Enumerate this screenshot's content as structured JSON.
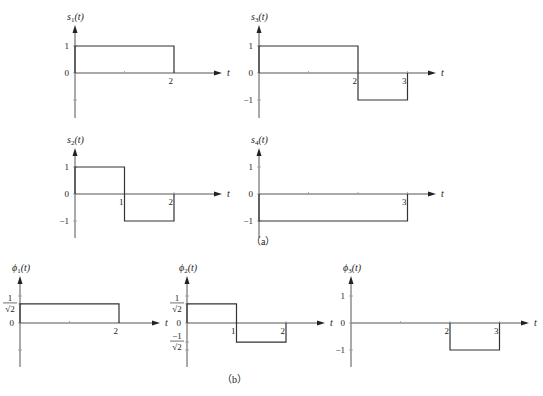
{
  "figure": {
    "part_a_caption": "（a）",
    "part_b_caption": "（b）",
    "time_axis_label": "t"
  },
  "plots": [
    {
      "id": "s1",
      "ylabel_base": "s",
      "ylabel_sub": "1",
      "ylabel_suffix": "(t)",
      "origin": [
        75,
        73
      ],
      "xunit": 49.5,
      "yunit": 27,
      "axis_top": 25,
      "axis_bottom": 118,
      "axis_right": 222,
      "yticks": [
        {
          "v": 1,
          "label": "1"
        },
        {
          "v": 0,
          "label": "0"
        },
        {
          "v": -1,
          "label": ""
        }
      ],
      "xticks": [
        {
          "v": 1,
          "label": ""
        },
        {
          "v": 2,
          "label": "2"
        }
      ],
      "segments": [
        {
          "t0": 0,
          "t1": 2,
          "v": 1
        }
      ]
    },
    {
      "id": "s3",
      "ylabel_base": "s",
      "ylabel_sub": "3",
      "ylabel_suffix": "(t)",
      "origin": [
        259,
        73
      ],
      "xunit": 49.5,
      "yunit": 27,
      "axis_top": 25,
      "axis_bottom": 118,
      "axis_right": 436,
      "yticks": [
        {
          "v": 1,
          "label": "1"
        },
        {
          "v": 0,
          "label": "0"
        },
        {
          "v": -1,
          "label": "−1"
        }
      ],
      "xticks": [
        {
          "v": 1,
          "label": ""
        },
        {
          "v": 2,
          "label": "2"
        },
        {
          "v": 3,
          "label": "3"
        }
      ],
      "segments": [
        {
          "t0": 0,
          "t1": 2,
          "v": 1
        },
        {
          "t0": 2,
          "t1": 3,
          "v": -1
        }
      ]
    },
    {
      "id": "s2",
      "ylabel_base": "s",
      "ylabel_sub": "2",
      "ylabel_suffix": "(t)",
      "origin": [
        75,
        194
      ],
      "xunit": 49.5,
      "yunit": 27,
      "axis_top": 148,
      "axis_bottom": 238,
      "axis_right": 222,
      "yticks": [
        {
          "v": 1,
          "label": "1"
        },
        {
          "v": 0,
          "label": "0"
        },
        {
          "v": -1,
          "label": "−1"
        }
      ],
      "xticks": [
        {
          "v": 1,
          "label": "1"
        },
        {
          "v": 2,
          "label": "2"
        }
      ],
      "segments": [
        {
          "t0": 0,
          "t1": 1,
          "v": 1
        },
        {
          "t0": 1,
          "t1": 2,
          "v": -1
        }
      ]
    },
    {
      "id": "s4",
      "ylabel_base": "s",
      "ylabel_sub": "4",
      "ylabel_suffix": "(t)",
      "origin": [
        259,
        194
      ],
      "xunit": 49.5,
      "yunit": 27,
      "axis_top": 148,
      "axis_bottom": 238,
      "axis_right": 436,
      "yticks": [
        {
          "v": 1,
          "label": "1"
        },
        {
          "v": 0,
          "label": "0"
        },
        {
          "v": -1,
          "label": "−1"
        }
      ],
      "xticks": [
        {
          "v": 1,
          "label": ""
        },
        {
          "v": 2,
          "label": ""
        },
        {
          "v": 3,
          "label": "3"
        }
      ],
      "segments": [
        {
          "t0": 0,
          "t1": 3,
          "v": -1
        }
      ]
    },
    {
      "id": "phi1",
      "ylabel_base": "ϕ",
      "ylabel_sub": "1",
      "ylabel_suffix": "(t)",
      "origin": [
        20,
        323
      ],
      "xunit": 49.5,
      "yunit": 27,
      "axis_top": 276,
      "axis_bottom": 367,
      "axis_right": 160,
      "yticks": [
        {
          "v": 0.7071,
          "label": "frac",
          "frac_num": "1",
          "frac_den": "√2"
        },
        {
          "v": 0,
          "label": "0"
        },
        {
          "v": 1,
          "label": ""
        },
        {
          "v": -1,
          "label": ""
        }
      ],
      "xticks": [
        {
          "v": 1,
          "label": ""
        },
        {
          "v": 2,
          "label": "2"
        }
      ],
      "segments": [
        {
          "t0": 0,
          "t1": 2,
          "v": 0.7071
        }
      ]
    },
    {
      "id": "phi2",
      "ylabel_base": "ϕ",
      "ylabel_sub": "2",
      "ylabel_suffix": "(t)",
      "origin": [
        187,
        323
      ],
      "xunit": 49.5,
      "yunit": 27,
      "axis_top": 276,
      "axis_bottom": 367,
      "axis_right": 325,
      "yticks": [
        {
          "v": 0.7071,
          "label": "frac",
          "frac_num": "1",
          "frac_den": "√2"
        },
        {
          "v": 0,
          "label": "0"
        },
        {
          "v": -0.7071,
          "label": "frac",
          "frac_num": "−1",
          "frac_den": "√2"
        },
        {
          "v": 1,
          "label": ""
        },
        {
          "v": -1,
          "label": ""
        }
      ],
      "xticks": [
        {
          "v": 1,
          "label": "1"
        },
        {
          "v": 2,
          "label": "2"
        }
      ],
      "segments": [
        {
          "t0": 0,
          "t1": 1,
          "v": 0.7071
        },
        {
          "t0": 1,
          "t1": 2,
          "v": -0.7071
        }
      ]
    },
    {
      "id": "phi3",
      "ylabel_base": "ϕ",
      "ylabel_sub": "3",
      "ylabel_suffix": "(t)",
      "origin": [
        351,
        323
      ],
      "xunit": 49.5,
      "yunit": 27,
      "axis_top": 276,
      "axis_bottom": 367,
      "axis_right": 529,
      "yticks": [
        {
          "v": 1,
          "label": "1"
        },
        {
          "v": 0,
          "label": "0"
        },
        {
          "v": -1,
          "label": "−1"
        }
      ],
      "xticks": [
        {
          "v": 1,
          "label": ""
        },
        {
          "v": 2,
          "label": "2"
        },
        {
          "v": 3,
          "label": "3"
        }
      ],
      "segments": [
        {
          "t0": 2,
          "t1": 3,
          "v": -1
        }
      ]
    }
  ]
}
